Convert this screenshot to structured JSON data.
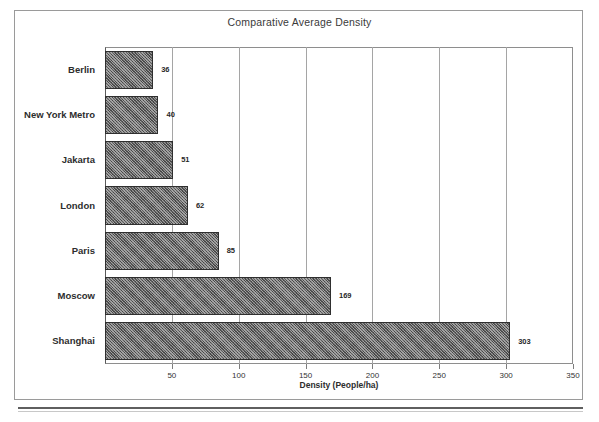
{
  "chart_data": {
    "type": "bar",
    "orientation": "horizontal",
    "title": "Comparative Average Density",
    "xlabel": "Density (People/ha)",
    "ylabel": "",
    "xlim": [
      0,
      350
    ],
    "xticks": [
      50,
      100,
      150,
      200,
      250,
      300,
      350
    ],
    "grid": true,
    "legend": null,
    "categories": [
      "Berlin",
      "New York Metro",
      "Jakarta",
      "London",
      "Paris",
      "Moscow",
      "Shanghai"
    ],
    "values": [
      36,
      40,
      51,
      62,
      85,
      169,
      303
    ],
    "value_labels": [
      "36",
      "40",
      "51",
      "62",
      "85",
      "169",
      "303"
    ],
    "bars": [
      {
        "category": "Berlin",
        "value": 36,
        "label": "36"
      },
      {
        "category": "New York Metro",
        "value": 40,
        "label": "40"
      },
      {
        "category": "Jakarta",
        "value": 51,
        "label": "51"
      },
      {
        "category": "London",
        "value": 62,
        "label": "62"
      },
      {
        "category": "Paris",
        "value": 85,
        "label": "85"
      },
      {
        "category": "Moscow",
        "value": 169,
        "label": "169"
      },
      {
        "category": "Shanghai",
        "value": 303,
        "label": "303"
      }
    ],
    "colors": {
      "bar_fill": "#5e5e5e",
      "bar_border": "#2f2f2f",
      "gridline": "#a5a5a5",
      "axis": "#5a5a5a",
      "text": "#2d2d2d",
      "background": "#ffffff"
    }
  }
}
